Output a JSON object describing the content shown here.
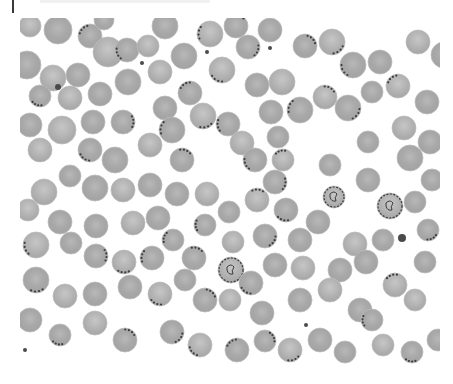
{
  "image": {
    "kind": "blood smear micrograph (grayscale)",
    "background_color": "#ffffff",
    "cell_fill_color": "#a9a9a9",
    "cell_edge_color": "#bcbcbc",
    "parasite_color": "#3c3c3c",
    "frame": {
      "x": 20,
      "y": 18,
      "width": 420,
      "height": 348
    }
  },
  "cells": [
    {
      "x": 30,
      "y": 26,
      "r": 11,
      "p": 0
    },
    {
      "x": 58,
      "y": 30,
      "r": 14,
      "p": 0
    },
    {
      "x": 90,
      "y": 36,
      "r": 12,
      "p": 1
    },
    {
      "x": 108,
      "y": 52,
      "r": 15,
      "p": 0
    },
    {
      "x": 104,
      "y": 20,
      "r": 10,
      "p": 0
    },
    {
      "x": 127,
      "y": 50,
      "r": 12,
      "p": 1
    },
    {
      "x": 148,
      "y": 46,
      "r": 11,
      "p": 0
    },
    {
      "x": 165,
      "y": 26,
      "r": 13,
      "p": 0
    },
    {
      "x": 184,
      "y": 56,
      "r": 13,
      "p": 0
    },
    {
      "x": 210,
      "y": 34,
      "r": 13,
      "p": 1
    },
    {
      "x": 236,
      "y": 26,
      "r": 12,
      "p": 1
    },
    {
      "x": 248,
      "y": 47,
      "r": 12,
      "p": 1
    },
    {
      "x": 222,
      "y": 70,
      "r": 13,
      "p": 1
    },
    {
      "x": 270,
      "y": 30,
      "r": 12,
      "p": 0
    },
    {
      "x": 305,
      "y": 46,
      "r": 12,
      "p": 1
    },
    {
      "x": 332,
      "y": 42,
      "r": 13,
      "p": 1
    },
    {
      "x": 353,
      "y": 65,
      "r": 13,
      "p": 1
    },
    {
      "x": 380,
      "y": 62,
      "r": 12,
      "p": 0
    },
    {
      "x": 418,
      "y": 42,
      "r": 12,
      "p": 0
    },
    {
      "x": 444,
      "y": 55,
      "r": 13,
      "p": 0
    },
    {
      "x": 27,
      "y": 65,
      "r": 14,
      "p": 0
    },
    {
      "x": 53,
      "y": 78,
      "r": 13,
      "p": 0
    },
    {
      "x": 78,
      "y": 75,
      "r": 12,
      "p": 0
    },
    {
      "x": 40,
      "y": 96,
      "r": 11,
      "p": 1
    },
    {
      "x": 70,
      "y": 98,
      "r": 12,
      "p": 0
    },
    {
      "x": 100,
      "y": 94,
      "r": 12,
      "p": 0
    },
    {
      "x": 128,
      "y": 82,
      "r": 13,
      "p": 0
    },
    {
      "x": 160,
      "y": 72,
      "r": 12,
      "p": 0
    },
    {
      "x": 190,
      "y": 93,
      "r": 12,
      "p": 1
    },
    {
      "x": 165,
      "y": 108,
      "r": 12,
      "p": 0
    },
    {
      "x": 203,
      "y": 116,
      "r": 13,
      "p": 1
    },
    {
      "x": 228,
      "y": 124,
      "r": 12,
      "p": 1
    },
    {
      "x": 257,
      "y": 85,
      "r": 12,
      "p": 0
    },
    {
      "x": 282,
      "y": 82,
      "r": 13,
      "p": 0
    },
    {
      "x": 271,
      "y": 112,
      "r": 12,
      "p": 0
    },
    {
      "x": 300,
      "y": 110,
      "r": 13,
      "p": 1
    },
    {
      "x": 325,
      "y": 97,
      "r": 12,
      "p": 1
    },
    {
      "x": 348,
      "y": 108,
      "r": 13,
      "p": 1
    },
    {
      "x": 372,
      "y": 92,
      "r": 11,
      "p": 0
    },
    {
      "x": 398,
      "y": 86,
      "r": 12,
      "p": 1
    },
    {
      "x": 427,
      "y": 102,
      "r": 12,
      "p": 0
    },
    {
      "x": 30,
      "y": 125,
      "r": 12,
      "p": 0
    },
    {
      "x": 62,
      "y": 130,
      "r": 14,
      "p": 0
    },
    {
      "x": 93,
      "y": 122,
      "r": 12,
      "p": 0
    },
    {
      "x": 123,
      "y": 122,
      "r": 12,
      "p": 1
    },
    {
      "x": 150,
      "y": 145,
      "r": 12,
      "p": 0
    },
    {
      "x": 172,
      "y": 130,
      "r": 13,
      "p": 1
    },
    {
      "x": 182,
      "y": 160,
      "r": 12,
      "p": 1
    },
    {
      "x": 40,
      "y": 150,
      "r": 12,
      "p": 0
    },
    {
      "x": 90,
      "y": 150,
      "r": 12,
      "p": 1
    },
    {
      "x": 115,
      "y": 160,
      "r": 13,
      "p": 0
    },
    {
      "x": 242,
      "y": 143,
      "r": 12,
      "p": 0
    },
    {
      "x": 278,
      "y": 137,
      "r": 11,
      "p": 0
    },
    {
      "x": 255,
      "y": 160,
      "r": 12,
      "p": 1
    },
    {
      "x": 283,
      "y": 160,
      "r": 11,
      "p": 1
    },
    {
      "x": 330,
      "y": 165,
      "r": 11,
      "p": 0
    },
    {
      "x": 368,
      "y": 142,
      "r": 11,
      "p": 0
    },
    {
      "x": 404,
      "y": 128,
      "r": 12,
      "p": 0
    },
    {
      "x": 410,
      "y": 158,
      "r": 13,
      "p": 0
    },
    {
      "x": 430,
      "y": 142,
      "r": 12,
      "p": 0
    },
    {
      "x": 44,
      "y": 192,
      "r": 13,
      "p": 0
    },
    {
      "x": 70,
      "y": 176,
      "r": 11,
      "p": 0
    },
    {
      "x": 95,
      "y": 188,
      "r": 13,
      "p": 0
    },
    {
      "x": 123,
      "y": 190,
      "r": 12,
      "p": 0
    },
    {
      "x": 150,
      "y": 185,
      "r": 12,
      "p": 0
    },
    {
      "x": 177,
      "y": 194,
      "r": 12,
      "p": 0
    },
    {
      "x": 207,
      "y": 194,
      "r": 12,
      "p": 0
    },
    {
      "x": 229,
      "y": 212,
      "r": 11,
      "p": 0
    },
    {
      "x": 205,
      "y": 225,
      "r": 11,
      "p": 1
    },
    {
      "x": 257,
      "y": 200,
      "r": 12,
      "p": 1
    },
    {
      "x": 275,
      "y": 182,
      "r": 12,
      "p": 1
    },
    {
      "x": 286,
      "y": 210,
      "r": 12,
      "p": 1
    },
    {
      "x": 334,
      "y": 197,
      "r": 11,
      "p": 2
    },
    {
      "x": 318,
      "y": 222,
      "r": 12,
      "p": 0
    },
    {
      "x": 368,
      "y": 180,
      "r": 12,
      "p": 0
    },
    {
      "x": 390,
      "y": 206,
      "r": 13,
      "p": 2
    },
    {
      "x": 415,
      "y": 202,
      "r": 11,
      "p": 0
    },
    {
      "x": 432,
      "y": 180,
      "r": 11,
      "p": 0
    },
    {
      "x": 28,
      "y": 210,
      "r": 11,
      "p": 0
    },
    {
      "x": 60,
      "y": 222,
      "r": 12,
      "p": 0
    },
    {
      "x": 96,
      "y": 226,
      "r": 12,
      "p": 0
    },
    {
      "x": 133,
      "y": 223,
      "r": 12,
      "p": 0
    },
    {
      "x": 158,
      "y": 218,
      "r": 12,
      "p": 0
    },
    {
      "x": 173,
      "y": 240,
      "r": 11,
      "p": 1
    },
    {
      "x": 233,
      "y": 242,
      "r": 11,
      "p": 0
    },
    {
      "x": 265,
      "y": 236,
      "r": 12,
      "p": 1
    },
    {
      "x": 300,
      "y": 240,
      "r": 12,
      "p": 0
    },
    {
      "x": 355,
      "y": 244,
      "r": 12,
      "p": 0
    },
    {
      "x": 383,
      "y": 240,
      "r": 11,
      "p": 0
    },
    {
      "x": 428,
      "y": 230,
      "r": 11,
      "p": 1
    },
    {
      "x": 36,
      "y": 245,
      "r": 13,
      "p": 1
    },
    {
      "x": 71,
      "y": 243,
      "r": 11,
      "p": 0
    },
    {
      "x": 96,
      "y": 256,
      "r": 12,
      "p": 1
    },
    {
      "x": 124,
      "y": 262,
      "r": 12,
      "p": 1
    },
    {
      "x": 152,
      "y": 258,
      "r": 12,
      "p": 1
    },
    {
      "x": 194,
      "y": 258,
      "r": 12,
      "p": 1
    },
    {
      "x": 231,
      "y": 270,
      "r": 13,
      "p": 2
    },
    {
      "x": 251,
      "y": 283,
      "r": 12,
      "p": 1
    },
    {
      "x": 275,
      "y": 265,
      "r": 12,
      "p": 0
    },
    {
      "x": 303,
      "y": 268,
      "r": 12,
      "p": 0
    },
    {
      "x": 340,
      "y": 270,
      "r": 12,
      "p": 0
    },
    {
      "x": 366,
      "y": 262,
      "r": 12,
      "p": 0
    },
    {
      "x": 395,
      "y": 285,
      "r": 12,
      "p": 1
    },
    {
      "x": 425,
      "y": 262,
      "r": 11,
      "p": 0
    },
    {
      "x": 36,
      "y": 280,
      "r": 13,
      "p": 1
    },
    {
      "x": 65,
      "y": 296,
      "r": 12,
      "p": 0
    },
    {
      "x": 95,
      "y": 294,
      "r": 12,
      "p": 0
    },
    {
      "x": 130,
      "y": 287,
      "r": 12,
      "p": 0
    },
    {
      "x": 160,
      "y": 294,
      "r": 12,
      "p": 1
    },
    {
      "x": 185,
      "y": 280,
      "r": 11,
      "p": 0
    },
    {
      "x": 205,
      "y": 300,
      "r": 12,
      "p": 1
    },
    {
      "x": 230,
      "y": 300,
      "r": 11,
      "p": 0
    },
    {
      "x": 262,
      "y": 313,
      "r": 12,
      "p": 0
    },
    {
      "x": 300,
      "y": 300,
      "r": 12,
      "p": 0
    },
    {
      "x": 330,
      "y": 290,
      "r": 12,
      "p": 0
    },
    {
      "x": 360,
      "y": 310,
      "r": 12,
      "p": 0
    },
    {
      "x": 372,
      "y": 320,
      "r": 11,
      "p": 1
    },
    {
      "x": 415,
      "y": 300,
      "r": 11,
      "p": 0
    },
    {
      "x": 30,
      "y": 320,
      "r": 12,
      "p": 0
    },
    {
      "x": 60,
      "y": 335,
      "r": 11,
      "p": 1
    },
    {
      "x": 95,
      "y": 323,
      "r": 12,
      "p": 0
    },
    {
      "x": 125,
      "y": 340,
      "r": 12,
      "p": 1
    },
    {
      "x": 172,
      "y": 332,
      "r": 12,
      "p": 1
    },
    {
      "x": 200,
      "y": 345,
      "r": 12,
      "p": 1
    },
    {
      "x": 237,
      "y": 350,
      "r": 12,
      "p": 1
    },
    {
      "x": 265,
      "y": 341,
      "r": 11,
      "p": 1
    },
    {
      "x": 290,
      "y": 350,
      "r": 12,
      "p": 1
    },
    {
      "x": 320,
      "y": 340,
      "r": 12,
      "p": 0
    },
    {
      "x": 345,
      "y": 352,
      "r": 11,
      "p": 0
    },
    {
      "x": 383,
      "y": 345,
      "r": 11,
      "p": 0
    },
    {
      "x": 412,
      "y": 352,
      "r": 11,
      "p": 1
    },
    {
      "x": 438,
      "y": 340,
      "r": 11,
      "p": 0
    }
  ],
  "debris": [
    {
      "x": 58,
      "y": 87,
      "r": 3
    },
    {
      "x": 142,
      "y": 63,
      "r": 2
    },
    {
      "x": 207,
      "y": 52,
      "r": 2
    },
    {
      "x": 270,
      "y": 48,
      "r": 2
    },
    {
      "x": 402,
      "y": 238,
      "r": 4
    },
    {
      "x": 306,
      "y": 325,
      "r": 2
    },
    {
      "x": 25,
      "y": 350,
      "r": 2
    }
  ]
}
